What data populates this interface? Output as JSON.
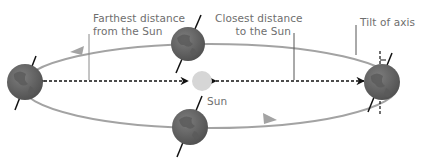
{
  "diagram": {
    "labels": {
      "farthest": [
        "Farthest distance",
        "from the Sun"
      ],
      "closest": [
        "Closest distance",
        "to the Sun"
      ],
      "tilt": "Tilt of axis",
      "sun": "Sun"
    },
    "colors": {
      "orbit": "#9a9a9a",
      "earth": "#6b6b6b",
      "earth_dark": "#4a4a4a",
      "sun": "#d6d6d6",
      "axis": "#1a1a1a",
      "leader": "#8a8a8a",
      "text": "#6e6e6e"
    },
    "positions": [
      {
        "name": "left",
        "role": "aphelion"
      },
      {
        "name": "top",
        "role": "orbit-position"
      },
      {
        "name": "bottom",
        "role": "orbit-position"
      },
      {
        "name": "right",
        "role": "perihelion"
      }
    ]
  }
}
